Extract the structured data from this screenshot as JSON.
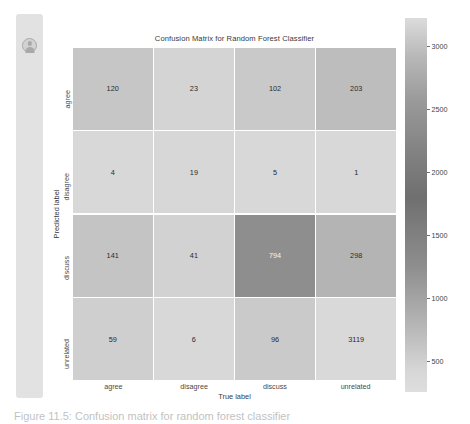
{
  "sidebar": {
    "avatar_icon": "person-avatar-icon"
  },
  "figure": {
    "title": "Confusion Matrix for Random Forest Classifier",
    "xlabel": "True label",
    "ylabel": "Predicted label"
  },
  "caption": {
    "text": "Figure 11.5: Confusion matrix for random forest classifier"
  },
  "colorbar": {
    "ticks": [
      3000,
      2500,
      2000,
      1500,
      1000,
      500
    ],
    "tick_labels": [
      "3000",
      "2500",
      "2000",
      "1500",
      "1000",
      "500"
    ],
    "vmin": 1,
    "vmax": 3119,
    "colormap": "grayscale-reversed",
    "color_light": "#dcdcdc",
    "color_dark": "#6f6f6f"
  },
  "chart_data": {
    "type": "heatmap",
    "title": "Confusion Matrix for Random Forest Classifier",
    "xlabel": "True label",
    "ylabel": "Predicted label",
    "categories": [
      "agree",
      "disagree",
      "discuss",
      "unrelated"
    ],
    "row_labels": [
      "agree",
      "disagree",
      "discuss",
      "unrelated"
    ],
    "col_labels": [
      "agree",
      "disagree",
      "discuss",
      "unrelated"
    ],
    "values": [
      [
        120,
        23,
        102,
        203
      ],
      [
        4,
        19,
        5,
        1
      ],
      [
        141,
        41,
        794,
        298
      ],
      [
        59,
        6,
        96,
        3119
      ]
    ],
    "cell_colors": [
      [
        "#c6c6c6",
        "#d4d4d4",
        "#c9c9c9",
        "#bdbdbd"
      ],
      [
        "#d8d8d8",
        "#d7d7d7",
        "#d8d8d8",
        "#d8d8d8"
      ],
      [
        "#c4c4c4",
        "#d2d2d2",
        "#8e8e8e",
        "#b4b4b4"
      ],
      [
        "#cfcfcf",
        "#d8d8d8",
        "#cacaca",
        "#d9d9d9"
      ]
    ],
    "cell_text_colors": [
      [
        "#2b2b2b",
        "#2b2b2b",
        "#2b2b2b",
        "#2b2b2b"
      ],
      [
        "#2b2b2b",
        "#2b2b2b",
        "#2b2b2b",
        "#2b2b2b"
      ],
      [
        "#2b2b2b",
        "#2b2b2b",
        "#f2f2f2",
        "#2b2b2b"
      ],
      [
        "#2b2b2b",
        "#2b2b2b",
        "#2b2b2b",
        "#2b2b2b"
      ]
    ],
    "colorbar_ticks": [
      500,
      1000,
      1500,
      2000,
      2500,
      3000
    ],
    "grid": false,
    "legend": "colorbar-right"
  }
}
